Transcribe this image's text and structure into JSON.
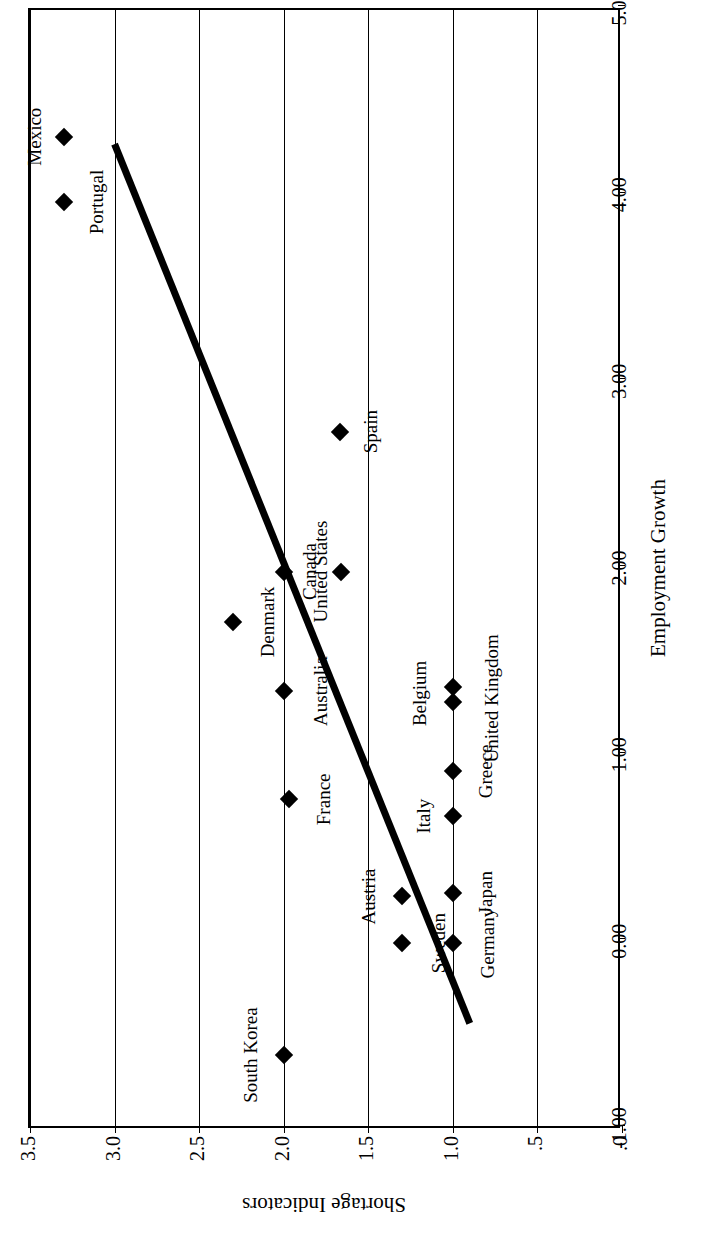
{
  "chart_data": {
    "type": "scatter",
    "title": "",
    "xlabel": "Employment Growth",
    "ylabel": "Shortage Indicators",
    "xlim": [
      -1.0,
      5.0
    ],
    "ylim": [
      0.0,
      3.5
    ],
    "xticks": [
      "-1.00",
      "0.00",
      "1.00",
      "2.00",
      "3.00",
      "4.00",
      "5.00"
    ],
    "xtick_values": [
      -1.0,
      0.0,
      1.0,
      2.0,
      3.0,
      4.0,
      5.0
    ],
    "yticks": [
      ".0",
      ".5",
      "1.0",
      "1.5",
      "2.0",
      "2.5",
      "3.0",
      "3.5"
    ],
    "ytick_values": [
      0.0,
      0.5,
      1.0,
      1.5,
      2.0,
      2.5,
      3.0,
      3.5
    ],
    "grid": "vertical-gridlines-on-shortage-axis",
    "legend": "none",
    "marker_style": "filled-black-diamond",
    "points": [
      {
        "label": "Mexico",
        "x": 4.3,
        "y": 3.3,
        "label_dx": 0,
        "label_dy": -30
      },
      {
        "label": "Portugal",
        "x": 3.95,
        "y": 3.3,
        "label_dx": 0,
        "label_dy": 32
      },
      {
        "label": "Denmark",
        "x": 1.7,
        "y": 2.3,
        "label_dx": 0,
        "label_dy": 34
      },
      {
        "label": "South Korea",
        "x": -0.62,
        "y": 2.0,
        "label_dx": 0,
        "label_dy": -34
      },
      {
        "label": "United States",
        "x": 1.97,
        "y": 2.0,
        "label_dx": 0,
        "label_dy": 36
      },
      {
        "label": "Australia",
        "x": 1.33,
        "y": 2.0,
        "label_dx": 0,
        "label_dy": 36
      },
      {
        "label": "France",
        "x": 0.75,
        "y": 1.97,
        "label_dx": 0,
        "label_dy": 34
      },
      {
        "label": "Canada",
        "x": 1.97,
        "y": 1.66,
        "label_dx": 0,
        "label_dy": -32
      },
      {
        "label": "Spain",
        "x": 2.72,
        "y": 1.67,
        "label_dx": 0,
        "label_dy": 30
      },
      {
        "label": "Sweden",
        "x": -0.02,
        "y": 1.3,
        "label_dx": 0,
        "label_dy": 36
      },
      {
        "label": "Austria",
        "x": 0.23,
        "y": 1.3,
        "label_dx": 0,
        "label_dy": -34
      },
      {
        "label": "Belgium",
        "x": 1.35,
        "y": 1.0,
        "label_dx": -6,
        "label_dy": -34
      },
      {
        "label": "United Kingdom",
        "x": 1.27,
        "y": 1.0,
        "label_dx": 4,
        "label_dy": 38
      },
      {
        "label": "Greece",
        "x": 0.9,
        "y": 1.0,
        "label_dx": 0,
        "label_dy": 32
      },
      {
        "label": "Italy",
        "x": 0.66,
        "y": 1.0,
        "label_dx": 0,
        "label_dy": -30
      },
      {
        "label": "Japan",
        "x": 0.25,
        "y": 1.0,
        "label_dx": 0,
        "label_dy": 32
      },
      {
        "label": "Germany",
        "x": -0.02,
        "y": 1.0,
        "label_dx": 0,
        "label_dy": 34
      }
    ],
    "trendline": {
      "type": "linear-fit",
      "x_start": 4.26,
      "y_start": 3.0,
      "x_end": -0.45,
      "y_end": 0.9,
      "color": "#000000",
      "width": 7
    }
  }
}
